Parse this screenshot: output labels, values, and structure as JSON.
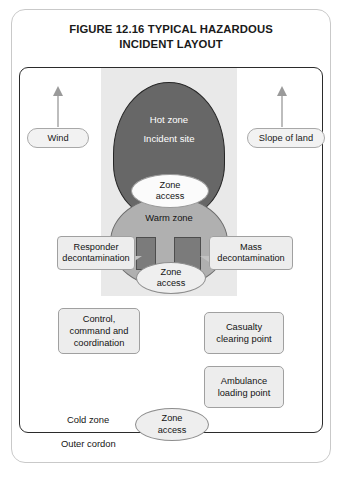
{
  "figure": {
    "title_line1": "FIGURE 12.16 TYPICAL HAZARDOUS",
    "title_line2": "INCIDENT LAYOUT"
  },
  "environment": {
    "wind_label": "Wind",
    "slope_label": "Slope of land",
    "wind_arrow_icon": "arrow-up-icon",
    "slope_arrow_icon": "arrow-up-icon"
  },
  "zones": {
    "hot": {
      "name": "Hot zone",
      "sublabel": "Incident site",
      "color": "#676767",
      "text_color": "#ffffff"
    },
    "warm": {
      "name": "Warm zone",
      "color": "#b0b0b0"
    },
    "cold": {
      "name": "Cold zone"
    },
    "outer_cordon": {
      "name": "Outer cordon"
    }
  },
  "access_points": [
    {
      "line1": "Zone",
      "line2": "access",
      "position": "hot-warm-boundary"
    },
    {
      "line1": "Zone",
      "line2": "access",
      "position": "warm-cold-boundary"
    },
    {
      "line1": "Zone",
      "line2": "access",
      "position": "cold-outer-cordon-boundary"
    }
  ],
  "decontamination": {
    "responder": {
      "line1": "Responder",
      "line2": "decontamination"
    },
    "mass": {
      "line1": "Mass",
      "line2": "decontamination"
    }
  },
  "facilities": [
    {
      "line1": "Control,",
      "line2": "command and",
      "line3": "coordination"
    },
    {
      "line1": "Casualty",
      "line2": "clearing point"
    },
    {
      "line1": "Ambulance",
      "line2": "loading point"
    }
  ],
  "colors": {
    "hot_zone": "#676767",
    "warm_zone": "#b0b0b0",
    "corridor": "#7b7b7b",
    "wind_band": "#e9e9e9",
    "box_fill": "#ededed",
    "frame_border": "#2b2b2b"
  }
}
